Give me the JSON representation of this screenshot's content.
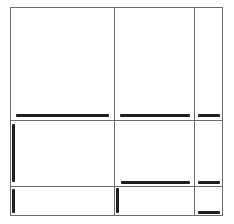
{
  "diagram": {
    "type": "grid-layout",
    "rows": 3,
    "columns": 3,
    "line_color": "#6b6b6b",
    "bar_color": "#1e1e1e",
    "cells": [
      {
        "row": 0,
        "col": 0,
        "marker": "bottom-bar"
      },
      {
        "row": 0,
        "col": 1,
        "marker": "bottom-bar"
      },
      {
        "row": 0,
        "col": 2,
        "marker": "bottom-bar"
      },
      {
        "row": 1,
        "col": 0,
        "marker": "left-bar"
      },
      {
        "row": 1,
        "col": 1,
        "marker": "bottom-bar"
      },
      {
        "row": 1,
        "col": 2,
        "marker": "bottom-bar"
      },
      {
        "row": 2,
        "col": 0,
        "marker": "left-bar"
      },
      {
        "row": 2,
        "col": 1,
        "marker": "left-bar"
      },
      {
        "row": 2,
        "col": 2,
        "marker": "bottom-bar"
      }
    ]
  }
}
